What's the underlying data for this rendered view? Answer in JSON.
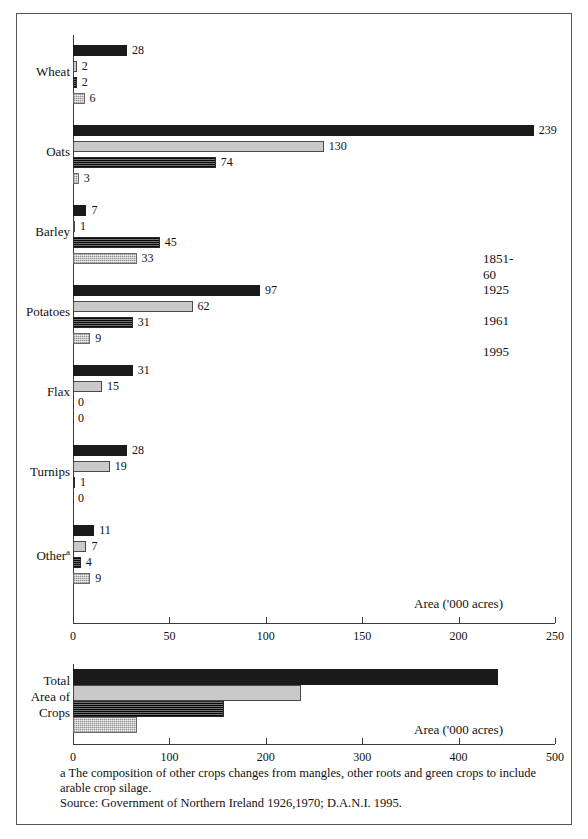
{
  "chart_data": [
    {
      "type": "bar",
      "orientation": "horizontal",
      "title": "",
      "xlabel": "Area ('000 acres)",
      "ylabel": "",
      "xlim": [
        0,
        250
      ],
      "xticks": [
        0,
        50,
        100,
        150,
        200,
        250
      ],
      "grid": false,
      "legend_position": "right-middle",
      "categories": [
        "Wheat",
        "Oats",
        "Barley",
        "Potatoes",
        "Flax",
        "Turnips",
        "Other"
      ],
      "category_footnote_marker": "a",
      "category_footnote_on": "Other",
      "series": [
        {
          "name": "1851-60",
          "color": "#1a1a1a",
          "values": [
            28,
            239,
            7,
            97,
            31,
            28,
            11
          ]
        },
        {
          "name": "1925",
          "color": "#c9c9c9",
          "values": [
            2,
            130,
            1,
            62,
            15,
            19,
            7
          ]
        },
        {
          "name": "1961",
          "color": "#3a3a3a",
          "values": [
            2,
            74,
            45,
            31,
            0,
            1,
            4
          ]
        },
        {
          "name": "1995",
          "color": "#c4c4c4",
          "values": [
            6,
            3,
            33,
            9,
            0,
            0,
            9
          ]
        }
      ]
    },
    {
      "type": "bar",
      "orientation": "horizontal",
      "title": "",
      "xlabel": "Area ('000 acres)",
      "ylabel": "",
      "xlim": [
        0,
        500
      ],
      "xticks": [
        0,
        100,
        200,
        300,
        400,
        500
      ],
      "grid": false,
      "categories": [
        "Total Area of Crops"
      ],
      "category_label_lines": [
        "Total",
        "Area of",
        "Crops"
      ],
      "series": [
        {
          "name": "1851-60",
          "color": "#1a1a1a",
          "values": [
            441
          ]
        },
        {
          "name": "1925",
          "color": "#c9c9c9",
          "values": [
            236
          ]
        },
        {
          "name": "1961",
          "color": "#3a3a3a",
          "values": [
            157
          ]
        },
        {
          "name": "1995",
          "color": "#c4c4c4",
          "values": [
            66
          ]
        }
      ]
    }
  ],
  "legend": {
    "items": [
      {
        "label": "1851-60",
        "swatch": "swatch-1851-60"
      },
      {
        "label": "1925",
        "swatch": "swatch-1925"
      },
      {
        "label": "1961",
        "swatch": "swatch-1961"
      },
      {
        "label": "1995",
        "swatch": "swatch-1995"
      }
    ]
  },
  "top_chart": {
    "axis_title": "Area ('000 acres)",
    "xticks": [
      "0",
      "50",
      "100",
      "150",
      "200",
      "250"
    ],
    "categories": [
      "Wheat",
      "Oats",
      "Barley",
      "Potatoes",
      "Flax",
      "Turnips",
      "Other"
    ],
    "other_superscript": "a",
    "bar_values": [
      [
        "28",
        "2",
        "2",
        "6"
      ],
      [
        "239",
        "130",
        "74",
        "3"
      ],
      [
        "7",
        "1",
        "45",
        "33"
      ],
      [
        "97",
        "62",
        "31",
        "9"
      ],
      [
        "31",
        "15",
        "0",
        "0"
      ],
      [
        "28",
        "19",
        "1",
        "0"
      ],
      [
        "11",
        "7",
        "4",
        "9"
      ]
    ]
  },
  "bottom_chart": {
    "axis_title": "Area ('000 acres)",
    "xticks": [
      "0",
      "100",
      "200",
      "300",
      "400",
      "500"
    ],
    "category_lines": [
      "Total",
      "Area of",
      "Crops"
    ]
  },
  "notes": {
    "footnote_line1": "a The composition of other crops changes from mangles, other roots and green crops to include",
    "footnote_line2": "arable crop silage.",
    "source": "Source: Government of Northern Ireland 1926,1970; D.A.N.I. 1995."
  }
}
